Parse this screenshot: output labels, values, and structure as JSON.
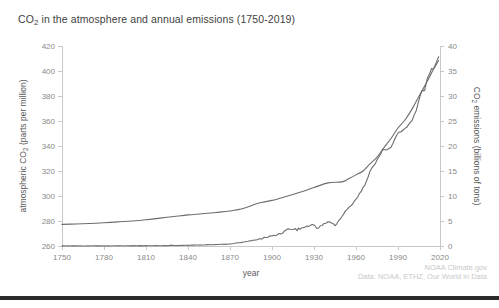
{
  "chart_data": {
    "type": "line",
    "title": "CO2 in the atmosphere and annual emissions (1750-2019)",
    "title_prefix": "CO",
    "title_sub": "2",
    "title_suffix": " in the atmosphere and annual emissions (1750-2019)",
    "xlabel": "year",
    "ylabel_left_prefix": "atmospheric CO",
    "ylabel_left_sub": "2",
    "ylabel_left_suffix": " (parts per million)",
    "ylabel_right_prefix": "CO",
    "ylabel_right_sub": "2",
    "ylabel_right_suffix": " emissions (billions of tons)",
    "xlim": [
      1750,
      2020
    ],
    "xticks": [
      1750,
      1780,
      1810,
      1840,
      1870,
      1900,
      1930,
      1960,
      1990,
      2020
    ],
    "ylim_left": [
      260,
      420
    ],
    "yticks_left": [
      260,
      280,
      300,
      320,
      340,
      360,
      380,
      400,
      420
    ],
    "ylim_right": [
      0,
      40
    ],
    "yticks_right": [
      0,
      5,
      10,
      15,
      20,
      25,
      30,
      35,
      40
    ],
    "grid": false,
    "legend": "none",
    "line_color": "#6d6d6d",
    "axis_color": "#c8c8c8",
    "tick_label_color": "#8a8a8a",
    "series": [
      {
        "name": "atmospheric CO2 concentration",
        "axis": "left",
        "units": "parts per million",
        "x": [
          1750,
          1760,
          1770,
          1780,
          1790,
          1800,
          1810,
          1820,
          1830,
          1840,
          1850,
          1860,
          1870,
          1880,
          1890,
          1900,
          1910,
          1920,
          1930,
          1940,
          1950,
          1955,
          1960,
          1965,
          1970,
          1975,
          1980,
          1985,
          1990,
          1995,
          2000,
          2005,
          2010,
          2015,
          2019
        ],
        "values": [
          277.3,
          277.6,
          278.0,
          278.6,
          279.3,
          280.0,
          281.0,
          282.3,
          283.6,
          284.9,
          285.8,
          286.8,
          288.0,
          290.2,
          294.2,
          296.5,
          299.6,
          303.0,
          306.8,
          310.5,
          311.3,
          314.0,
          316.9,
          320.0,
          325.7,
          331.1,
          338.7,
          346.0,
          354.4,
          360.8,
          369.5,
          379.8,
          389.9,
          400.8,
          411.4
        ]
      },
      {
        "name": "annual CO2 emissions",
        "axis": "right",
        "units": "billions of tons",
        "x": [
          1750,
          1770,
          1790,
          1810,
          1830,
          1850,
          1860,
          1870,
          1880,
          1890,
          1900,
          1905,
          1910,
          1913,
          1918,
          1920,
          1925,
          1929,
          1932,
          1937,
          1940,
          1943,
          1945,
          1950,
          1955,
          1960,
          1965,
          1970,
          1975,
          1979,
          1982,
          1985,
          1990,
          1992,
          1995,
          2000,
          2003,
          2007,
          2009,
          2011,
          2014,
          2016,
          2019
        ],
        "values": [
          0.01,
          0.02,
          0.03,
          0.05,
          0.1,
          0.2,
          0.3,
          0.4,
          0.8,
          1.3,
          2.0,
          2.4,
          3.1,
          3.5,
          3.3,
          3.5,
          3.9,
          4.3,
          3.5,
          4.5,
          4.8,
          4.6,
          4.0,
          6.0,
          7.7,
          9.4,
          11.5,
          14.9,
          17.0,
          19.5,
          19.0,
          19.8,
          22.6,
          22.8,
          23.5,
          25.0,
          27.0,
          31.2,
          31.0,
          33.5,
          35.5,
          35.7,
          37.1
        ]
      }
    ],
    "credits": [
      "NOAA Climate.gov",
      "Data: NOAA, ETHZ, Our World in Data"
    ]
  }
}
